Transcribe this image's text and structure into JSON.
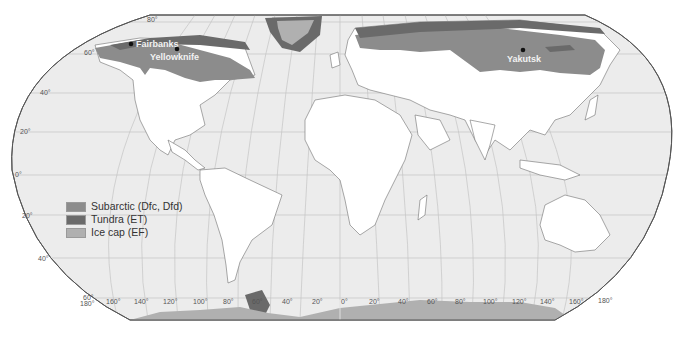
{
  "map": {
    "colors": {
      "ocean": "#ececec",
      "land": "#ffffff",
      "subarctic": "#8c8c8c",
      "tundra": "#6a6a6a",
      "icecap": "#b0b0b0",
      "grid": "#c4c4c4",
      "border": "#6e6e6e"
    },
    "latitude_labels": [
      "80°",
      "60°",
      "40°",
      "20°",
      "0°",
      "20°",
      "40°",
      "60°"
    ],
    "longitude_labels": [
      "180°",
      "160°",
      "140°",
      "120°",
      "100°",
      "80°",
      "60°",
      "40°",
      "20°",
      "0°",
      "20°",
      "40°",
      "60°",
      "80°",
      "100°",
      "120°",
      "140°",
      "160°",
      "180°"
    ],
    "cities": [
      {
        "name": "Fairbanks"
      },
      {
        "name": "Yellowknife"
      },
      {
        "name": "Yakutsk"
      }
    ]
  },
  "legend": {
    "items": [
      {
        "label": "Subarctic (Dfc, Dfd)",
        "color": "#8c8c8c"
      },
      {
        "label": "Tundra (ET)",
        "color": "#6a6a6a"
      },
      {
        "label": "Ice cap (EF)",
        "color": "#b0b0b0"
      }
    ]
  }
}
